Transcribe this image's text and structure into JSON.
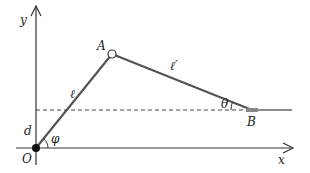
{
  "diagram": {
    "labels": {
      "y_axis": "y",
      "x_axis": "x",
      "origin": "O",
      "point_a": "A",
      "point_b": "B",
      "link_l": "ℓ",
      "link_l_prime": "ℓ′",
      "angle_theta": "θ",
      "angle_phi": "φ",
      "offset_d": "d"
    },
    "colors": {
      "axis": "#333333",
      "link": "#555555",
      "dashed": "#444444",
      "origin_dot": "#111111"
    }
  }
}
